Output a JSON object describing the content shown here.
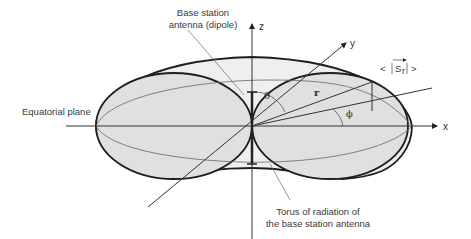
{
  "diagram": {
    "labels": {
      "antenna": [
        "Base station",
        "antenna (dipole)"
      ],
      "equatorial_plane": "Equatorial plane",
      "torus": [
        "Torus of radiation of",
        "the base station antenna"
      ],
      "poynting": "< |S⃗r| >",
      "poynting_left": "<",
      "poynting_main": "S",
      "poynting_sub": "r",
      "poynting_right": ">"
    },
    "axes": {
      "x": "x",
      "y": "y",
      "z": "z"
    },
    "symbols": {
      "theta": "θ",
      "phi": "ϕ",
      "radius": "r"
    },
    "colors": {
      "fill": "#e3e3e3",
      "stroke": "#1e1e1e",
      "thin_line": "#555555",
      "text": "#3a3a3a"
    }
  }
}
